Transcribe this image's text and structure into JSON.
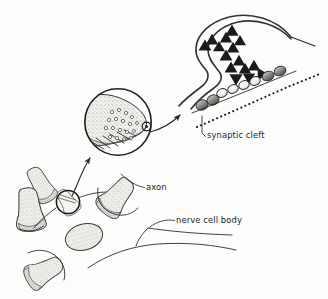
{
  "figure": {
    "title": "Synapse and nerve cell diagram",
    "style": "hand-drawn pen-and-ink scientific illustration",
    "background_color": "#fdfdfc",
    "ink_color": "#2b2b2b",
    "canvas": {
      "width": 328,
      "height": 299
    }
  },
  "labels": [
    {
      "id": "synaptic-cleft",
      "text": "synaptic cleft",
      "x": 207,
      "y": 138,
      "anchor": "start",
      "leader": "M205.5,136.5 L202,133 L202,116"
    },
    {
      "id": "axon",
      "text": "axon",
      "x": 146,
      "y": 190,
      "anchor": "start",
      "leader": "M144.5,187.5 C136,186 128,181 121,174"
    },
    {
      "id": "nerve-cell-body",
      "text": "nerve cell body",
      "x": 176,
      "y": 223,
      "anchor": "start",
      "leader": "M174.5,220.5 C166,219 158,221 150,227"
    }
  ],
  "panels": {
    "overview": {
      "name": "nerve cell body with axon terminals",
      "description": "Low magnification view of a nerve cell body surrounded by several bell-shaped axon terminals (boutons)"
    },
    "lens": {
      "name": "magnified axon terminal",
      "description": "Circular magnified inset showing a single stippled axon terminal filled with synaptic vesicles",
      "center_x": 118,
      "center_y": 122,
      "radius": 34
    },
    "detail": {
      "name": "synapse ultrastructure",
      "description": "High magnification of the presynaptic bulb releasing neurotransmitter triangles across the synaptic cleft toward receptor beads"
    }
  },
  "arrows": [
    {
      "id": "arrow-overview-to-lens",
      "from": "circled axon terminal",
      "to": "magnified inset",
      "path": "M72,199 C78,186 84,172 93,158"
    },
    {
      "id": "arrow-lens-to-detail",
      "from": "magnified inset",
      "to": "synapse ultrastructure",
      "path": "M150,130 C163,126 174,120 183,113"
    }
  ],
  "boutons": [
    {
      "id": "bouton-upper-left",
      "cx": 42,
      "cy": 186,
      "rot": -28,
      "scale": 0.84
    },
    {
      "id": "bouton-left",
      "cx": 30,
      "cy": 208,
      "rot": -8,
      "scale": 1.0
    },
    {
      "id": "bouton-circled",
      "cx": 68,
      "cy": 202,
      "rot": -34,
      "scale": 0.62
    },
    {
      "id": "bouton-middle",
      "cx": 114,
      "cy": 198,
      "rot": 38,
      "scale": 0.95
    },
    {
      "id": "bouton-bottom-left",
      "cx": 42,
      "cy": 270,
      "rot": 60,
      "scale": 0.9
    }
  ],
  "soma": {
    "cx": 84,
    "cy": 237,
    "rx": 19,
    "ry": 13,
    "rot": -16
  },
  "marker_circle": {
    "cx": 68,
    "cy": 202,
    "r": 12
  },
  "vesicle_triangles": [
    {
      "x": 232,
      "y": 31,
      "size": 6.6,
      "dir": "up"
    },
    {
      "x": 212,
      "y": 40,
      "size": 6.2,
      "dir": "up"
    },
    {
      "x": 226,
      "y": 38,
      "size": 6.2,
      "dir": "up"
    },
    {
      "x": 240,
      "y": 41,
      "size": 6.0,
      "dir": "up"
    },
    {
      "x": 205,
      "y": 46,
      "size": 6.4,
      "dir": "up"
    },
    {
      "x": 219,
      "y": 47,
      "size": 6.0,
      "dir": "up"
    },
    {
      "x": 233,
      "y": 48,
      "size": 6.2,
      "dir": "up"
    },
    {
      "x": 226,
      "y": 56,
      "size": 6.4,
      "dir": "up"
    },
    {
      "x": 239,
      "y": 61,
      "size": 6.2,
      "dir": "up"
    },
    {
      "x": 231,
      "y": 68,
      "size": 6.4,
      "dir": "up"
    },
    {
      "x": 245,
      "y": 69,
      "size": 6.2,
      "dir": "up"
    },
    {
      "x": 254,
      "y": 66,
      "size": 6.2,
      "dir": "up"
    },
    {
      "x": 236,
      "y": 79,
      "size": 6.6,
      "dir": "down"
    },
    {
      "x": 249,
      "y": 78,
      "size": 6.2,
      "dir": "down"
    },
    {
      "x": 262,
      "y": 74,
      "size": 6.0,
      "dir": "right"
    }
  ],
  "receptor_beads": [
    {
      "cx": 222,
      "cy": 93,
      "rx": 5.4,
      "ry": 4.2,
      "rot": -22,
      "shade": "light"
    },
    {
      "cx": 233,
      "cy": 89,
      "rx": 5.4,
      "ry": 4.2,
      "rot": -22,
      "shade": "light"
    },
    {
      "cx": 244,
      "cy": 85,
      "rx": 5.4,
      "ry": 4.2,
      "rot": -22,
      "shade": "light"
    },
    {
      "cx": 255,
      "cy": 81,
      "rx": 5.4,
      "ry": 4.2,
      "rot": -22,
      "shade": "light"
    },
    {
      "cx": 268,
      "cy": 76,
      "rx": 6.0,
      "ry": 4.6,
      "rot": -22,
      "shade": "dark"
    },
    {
      "cx": 280,
      "cy": 71,
      "rx": 6.0,
      "ry": 4.6,
      "rot": -22,
      "shade": "dark"
    },
    {
      "cx": 213,
      "cy": 100,
      "rx": 6.2,
      "ry": 5.0,
      "rot": -22,
      "shade": "dark"
    },
    {
      "cx": 202,
      "cy": 105,
      "rx": 6.2,
      "ry": 5.0,
      "rot": -22,
      "shade": "dark"
    }
  ],
  "lens_vesicles": [
    {
      "cx": 112,
      "cy": 112,
      "r": 1.7
    },
    {
      "cx": 119,
      "cy": 110,
      "r": 1.6
    },
    {
      "cx": 126,
      "cy": 113,
      "r": 1.7
    },
    {
      "cx": 132,
      "cy": 117,
      "r": 1.6
    },
    {
      "cx": 109,
      "cy": 120,
      "r": 1.7
    },
    {
      "cx": 116,
      "cy": 119,
      "r": 1.6
    },
    {
      "cx": 123,
      "cy": 121,
      "r": 1.7
    },
    {
      "cx": 130,
      "cy": 124,
      "r": 1.6
    },
    {
      "cx": 137,
      "cy": 123,
      "r": 1.5
    },
    {
      "cx": 106,
      "cy": 128,
      "r": 1.7
    },
    {
      "cx": 113,
      "cy": 128,
      "r": 1.6
    },
    {
      "cx": 120,
      "cy": 130,
      "r": 1.7
    },
    {
      "cx": 127,
      "cy": 132,
      "r": 1.6
    },
    {
      "cx": 134,
      "cy": 131,
      "r": 1.5
    },
    {
      "cx": 110,
      "cy": 137,
      "r": 1.6
    },
    {
      "cx": 117,
      "cy": 138,
      "r": 1.6
    },
    {
      "cx": 124,
      "cy": 139,
      "r": 1.5
    },
    {
      "cx": 131,
      "cy": 138,
      "r": 1.5
    }
  ]
}
